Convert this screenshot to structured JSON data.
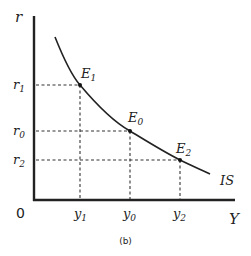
{
  "diagram": {
    "caption": "(b)",
    "axes": {
      "y_label": "r",
      "x_label": "Y",
      "origin_label": "0"
    },
    "curve_label": "IS",
    "points": [
      {
        "name": "E",
        "sub": "1",
        "x_label": "y",
        "x_sub": "1",
        "y_label": "r",
        "y_sub": "1"
      },
      {
        "name": "E",
        "sub": "0",
        "x_label": "y",
        "x_sub": "0",
        "y_label": "r",
        "y_sub": "0"
      },
      {
        "name": "E",
        "sub": "2",
        "x_label": "y",
        "x_sub": "2",
        "y_label": "r",
        "y_sub": "2"
      }
    ],
    "colors": {
      "line": "#222222",
      "background": "#ffffff"
    }
  }
}
